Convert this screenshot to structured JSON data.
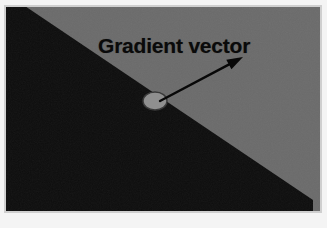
{
  "figure": {
    "kind": "diagram-image",
    "annotation_label": "Gradient vector",
    "regions": [
      {
        "name": "dark-region",
        "color": "#0d0d0d",
        "position": "lower-left"
      },
      {
        "name": "light-region",
        "color": "#6b6b6b",
        "position": "upper-right"
      }
    ],
    "edge": {
      "name": "intensity-edge",
      "description": "straight diagonal boundary from upper-left to lower-right",
      "start_point": [
        16,
        0
      ],
      "end_point": [
        313,
        200
      ]
    },
    "marker": {
      "name": "edge-point-marker",
      "shape": "ellipse",
      "center": [
        155,
        101
      ],
      "radius_x": 12,
      "radius_y": 9,
      "fill": "#8f8f8f",
      "stroke": "#3a3a3a"
    },
    "arrow": {
      "name": "gradient-vector-arrow",
      "tail": [
        160,
        101
      ],
      "tip": [
        243,
        57
      ],
      "color": "#080808",
      "line_width": 2.4,
      "head_length": 16,
      "head_width": 11
    },
    "frame": {
      "border_color": "#cfcfcf",
      "page_color": "#f4f4f4"
    }
  }
}
